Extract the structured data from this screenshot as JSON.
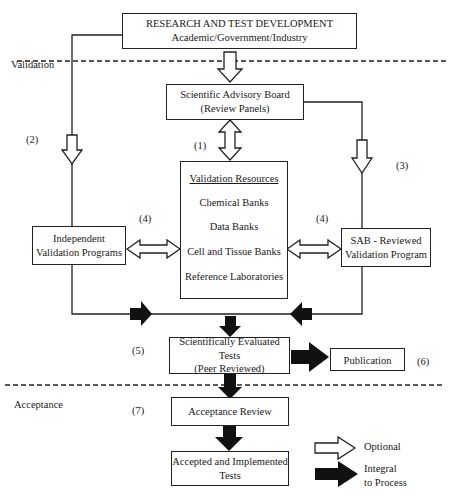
{
  "diagram": {
    "sections": {
      "validation": "Validation",
      "acceptance": "Acceptance"
    },
    "boxes": {
      "research": {
        "title": "RESEARCH AND TEST DEVELOPMENT",
        "subtitle": "Academic/Government/Industry"
      },
      "sab": {
        "line1": "Scientific Advisory Board",
        "line2": "(Review Panels)"
      },
      "resources": {
        "title": "Validation Resources",
        "items": [
          "Chemical Banks",
          "Data Banks",
          "Cell and Tissue Banks",
          "Reference Laboratories"
        ]
      },
      "independent": {
        "line1": "Independent",
        "line2": "Validation Programs"
      },
      "sab_reviewed": {
        "line1": "SAB - Reviewed",
        "line2": "Validation Program"
      },
      "evaluated": {
        "line1": "Scientifically Evaluated Tests",
        "line2": "(Peer Reviewed)"
      },
      "publication": "Publication",
      "acceptance_review": "Acceptance Review",
      "accepted": {
        "line1": "Accepted and Implemented",
        "line2": "Tests"
      }
    },
    "step_labels": {
      "s1": "(1)",
      "s2": "(2)",
      "s3": "(3)",
      "s4_left": "(4)",
      "s4_right": "(4)",
      "s5": "(5)",
      "s6": "(6)",
      "s7": "(7)"
    },
    "legend": {
      "optional": "Optional",
      "integral_line1": "Integral",
      "integral_line2": "to Process"
    }
  }
}
